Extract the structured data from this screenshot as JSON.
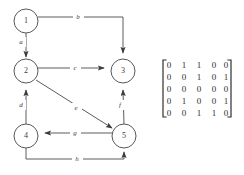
{
  "figure": {
    "stroke_color": "#58585a",
    "text_color": "#3b3b3d",
    "background": "#ffffff"
  },
  "graph": {
    "nodes": [
      {
        "id": "1",
        "label": "1",
        "cx": 26,
        "cy": 21,
        "r": 12
      },
      {
        "id": "2",
        "label": "2",
        "cx": 26,
        "cy": 71,
        "r": 12
      },
      {
        "id": "3",
        "label": "3",
        "cx": 123,
        "cy": 71,
        "r": 12
      },
      {
        "id": "4",
        "label": "4",
        "cx": 26,
        "cy": 136,
        "r": 12
      },
      {
        "id": "5",
        "label": "5",
        "cx": 124,
        "cy": 136,
        "r": 12
      }
    ],
    "edges": [
      {
        "id": "a",
        "label": "a",
        "from": "1",
        "to": "2",
        "label_x": 21,
        "label_y": 42
      },
      {
        "id": "b",
        "label": "b",
        "from": "1",
        "to": "3",
        "label_x": 78,
        "label_y": 17
      },
      {
        "id": "c",
        "label": "c",
        "from": "2",
        "to": "3",
        "label_x": 75,
        "label_y": 68
      },
      {
        "id": "d",
        "label": "d",
        "from": "4",
        "to": "2",
        "label_x": 21,
        "label_y": 105
      },
      {
        "id": "e",
        "label": "e",
        "from": "2",
        "to": "5",
        "label_x": 76,
        "label_y": 108
      },
      {
        "id": "f",
        "label": "f",
        "from": "5",
        "to": "3",
        "label_x": 120,
        "label_y": 105
      },
      {
        "id": "g",
        "label": "g",
        "from": "5",
        "to": "4",
        "label_x": 75,
        "label_y": 133
      },
      {
        "id": "h",
        "label": "h",
        "from": "4",
        "to": "5",
        "label_x": 77,
        "label_y": 159
      }
    ]
  },
  "matrix": {
    "rows": [
      [
        "0",
        "1",
        "1",
        "0",
        "0"
      ],
      [
        "0",
        "0",
        "1",
        "0",
        "1"
      ],
      [
        "0",
        "0",
        "0",
        "0",
        "0"
      ],
      [
        "0",
        "1",
        "0",
        "0",
        "1"
      ],
      [
        "0",
        "0",
        "1",
        "1",
        "0"
      ]
    ],
    "bracket_color": "#2f2f31"
  }
}
